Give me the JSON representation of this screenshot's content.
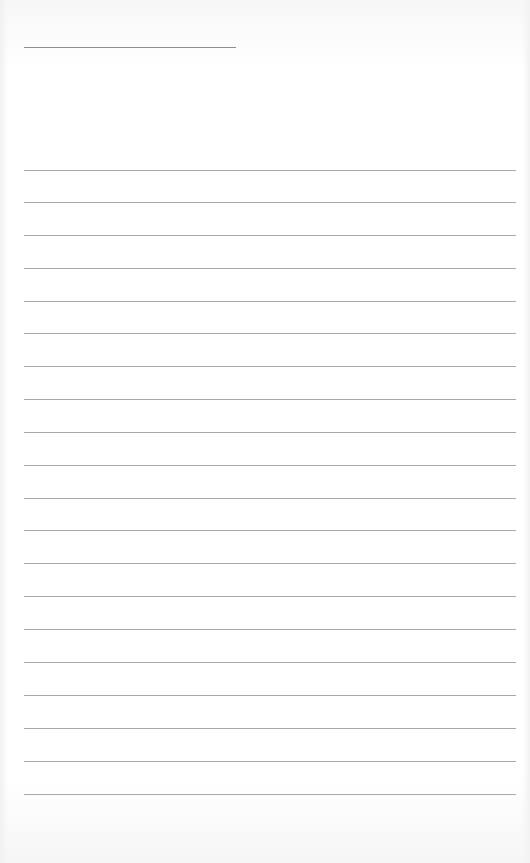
{
  "page": {
    "type": "lined-paper",
    "background_color": "#ffffff",
    "line_color": "#9a9a9a"
  },
  "title_line": {
    "x_start": 24,
    "x_end": 236,
    "y": 47
  },
  "writing_lines": {
    "count": 20,
    "x_start": 24,
    "x_end": 516,
    "y_positions": [
      170,
      202,
      235,
      268,
      301,
      333,
      366,
      399,
      432,
      465,
      498,
      530,
      563,
      596,
      629,
      662,
      695,
      728,
      761,
      794
    ]
  }
}
